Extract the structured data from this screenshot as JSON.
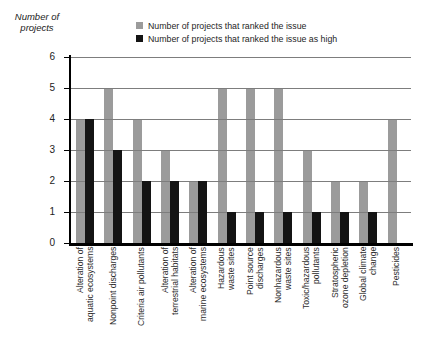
{
  "chart_data": {
    "type": "bar",
    "title": "",
    "ylabel": "Number of\nprojects",
    "xlabel": "",
    "ylim": [
      0,
      6
    ],
    "yticks": [
      0,
      1,
      2,
      3,
      4,
      5,
      6
    ],
    "grid": true,
    "legend_position": "top",
    "categories": [
      "Alteration of\naquatic ecosystems",
      "Nonpoint discharges",
      "Criteria air pollutants",
      "Alteration of\nterrestrial habitats",
      "Alteration of\nmarine ecosystems",
      "Hazardous\nwaste sites",
      "Point source\ndischarges",
      "Nonhazardous\nwaste sites",
      "Toxic/hazardous\npollutants",
      "Stratospheric\nozone depletion",
      "Global climate\nchange",
      "Pesticides"
    ],
    "series": [
      {
        "name": "Number of projects that ranked the issue",
        "color": "#9b9b9b",
        "values": [
          4,
          5,
          4,
          3,
          2,
          5,
          5,
          5,
          3,
          2,
          2,
          4
        ]
      },
      {
        "name": "Number of projects that ranked the issue as high",
        "color": "#141414",
        "values": [
          4,
          3,
          2,
          2,
          2,
          1,
          1,
          1,
          1,
          1,
          1,
          0
        ]
      }
    ]
  },
  "colors": {
    "gridline": "#7d7d7d",
    "axis": "#000000",
    "background": "#ffffff",
    "text": "#222222"
  }
}
